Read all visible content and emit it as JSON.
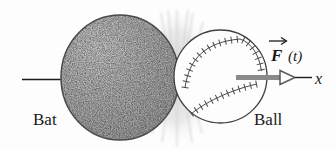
{
  "figure": {
    "bat_label": "Bat",
    "ball_label": "Ball",
    "force_label": "F",
    "force_arg_label": "(t)",
    "axis_label": "x"
  },
  "colors": {
    "background": "#fdfdfd",
    "bat_fill": "#a7a7a7",
    "bat_outline": "#4a4a4a",
    "ball_fill": "#fdfdfd",
    "ball_outline": "#3f3f3f",
    "stitch_color": "#4a4a4a",
    "force_arrow_fill": "#8a8a8a",
    "arrowhead_outline": "#5a5a5a",
    "axis_line_color": "#1c1c1c",
    "burst_color": "#d0d0d0",
    "label_color": "#1a1a1a"
  }
}
